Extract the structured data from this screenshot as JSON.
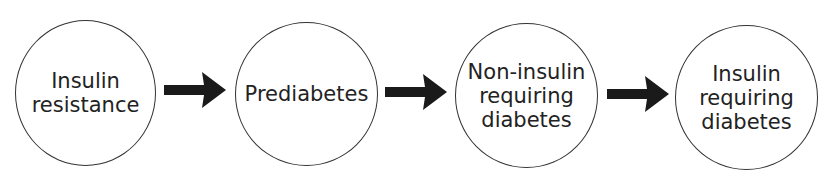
{
  "diagram": {
    "type": "flow",
    "direction": "left-to-right",
    "nodes": [
      {
        "id": "n1",
        "lines": [
          "Insulin",
          "resistance"
        ]
      },
      {
        "id": "n2",
        "lines": [
          "Prediabetes"
        ]
      },
      {
        "id": "n3",
        "lines": [
          "Non-insulin",
          "requiring",
          "diabetes"
        ]
      },
      {
        "id": "n4",
        "lines": [
          "Insulin",
          "requiring",
          "diabetes"
        ]
      }
    ],
    "edges": [
      {
        "from": "n1",
        "to": "n2"
      },
      {
        "from": "n2",
        "to": "n3"
      },
      {
        "from": "n3",
        "to": "n4"
      }
    ],
    "colors": {
      "stroke": "#333333",
      "arrow": "#1a1a1a",
      "text": "#222222",
      "background": "#ffffff"
    }
  }
}
